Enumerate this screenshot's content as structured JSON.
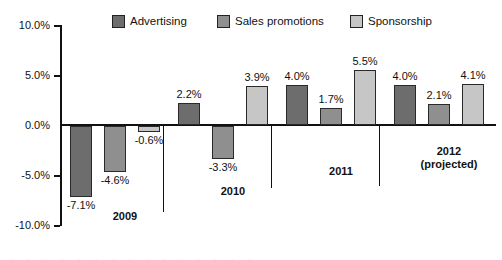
{
  "chart_data": {
    "type": "bar",
    "title": "",
    "xlabel": "",
    "ylabel": "",
    "ylim": [
      -10,
      10
    ],
    "grid": false,
    "legend_position": "top",
    "y_unit": "%",
    "y_ticks": [
      "10.0%",
      "5.0%",
      "0.0%",
      "-5.0%",
      "-10.0%"
    ],
    "y_tick_values": [
      10,
      5,
      0,
      -5,
      -10
    ],
    "categories": [
      "2009",
      "2010",
      "2011",
      "2012 (projected)"
    ],
    "category_labels": [
      {
        "line1": "2009",
        "line2": ""
      },
      {
        "line1": "2010",
        "line2": ""
      },
      {
        "line1": "2011",
        "line2": ""
      },
      {
        "line1": "2012",
        "line2": "(projected)"
      }
    ],
    "series": [
      {
        "name": "Advertising",
        "color": "#6d6d6d",
        "values": [
          -7.1,
          2.2,
          4.0,
          4.0
        ],
        "labels": [
          "-7.1%",
          "2.2%",
          "4.0%",
          "4.0%"
        ]
      },
      {
        "name": "Sales promotions",
        "color": "#8f8f8f",
        "values": [
          -4.6,
          -3.3,
          1.7,
          2.1
        ],
        "labels": [
          "-4.6%",
          "-3.3%",
          "1.7%",
          "2.1%"
        ]
      },
      {
        "name": "Sponsorship",
        "color": "#c6c6c6",
        "values": [
          -0.6,
          3.9,
          5.5,
          4.1
        ],
        "labels": [
          "-0.6%",
          "3.9%",
          "5.5%",
          "4.1%"
        ]
      }
    ]
  },
  "legend": {
    "items": [
      {
        "label": "Advertising",
        "color": "#6d6d6d"
      },
      {
        "label": "Sales promotions",
        "color": "#8f8f8f"
      },
      {
        "label": "Sponsorship",
        "color": "#c6c6c6"
      }
    ]
  },
  "axis": {
    "tick_10": "10.0%",
    "tick_5": "5.0%",
    "tick_0": "0.0%",
    "tick_m5": "-5.0%",
    "tick_m10": "-10.0%"
  }
}
